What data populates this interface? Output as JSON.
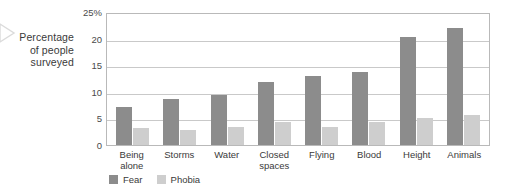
{
  "caption": {
    "line1": "Percentage",
    "line2": "of people",
    "line3": "surveyed"
  },
  "colors": {
    "fear": "#8c8c8c",
    "phobia": "#cecece",
    "grid": "#c9c9c9",
    "frame": "#b9b9b9",
    "text": "#3a3a3a"
  },
  "chart_data": {
    "type": "bar",
    "title": "",
    "xlabel": "",
    "ylabel": "Percentage of people surveyed",
    "ylim": [
      0,
      25
    ],
    "yticks": [
      "0",
      "5",
      "10",
      "15",
      "20",
      "25%"
    ],
    "ytick_values": [
      0,
      5,
      10,
      15,
      20,
      25
    ],
    "grid": true,
    "grid_axis": "y",
    "legend_position": "bottom-left",
    "categories": [
      "Being\nalone",
      "Storms",
      "Water",
      "Closed\nspaces",
      "Flying",
      "Blood",
      "Height",
      "Animals"
    ],
    "series": [
      {
        "name": "Fear",
        "color": "#8c8c8c",
        "values": [
          7.2,
          8.6,
          9.4,
          11.9,
          13.0,
          13.8,
          20.3,
          22.0
        ]
      },
      {
        "name": "Phobia",
        "color": "#cecece",
        "values": [
          3.2,
          2.9,
          3.3,
          4.3,
          3.4,
          4.4,
          5.0,
          5.6
        ]
      }
    ]
  },
  "categories_display": [
    {
      "l1": "Being",
      "l2": "alone"
    },
    {
      "l1": "Storms",
      "l2": ""
    },
    {
      "l1": "Water",
      "l2": ""
    },
    {
      "l1": "Closed",
      "l2": "spaces"
    },
    {
      "l1": "Flying",
      "l2": ""
    },
    {
      "l1": "Blood",
      "l2": ""
    },
    {
      "l1": "Height",
      "l2": ""
    },
    {
      "l1": "Animals",
      "l2": ""
    }
  ]
}
